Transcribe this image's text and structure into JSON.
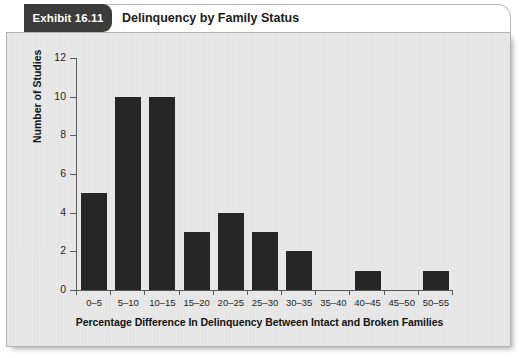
{
  "exhibit": {
    "tab_label": "Exhibit 16.11",
    "title": "Delinquency by Family Status",
    "tab_color": "#3b3b3b",
    "panel_bg": "#e9e9e9"
  },
  "chart_data": {
    "type": "bar",
    "title": "Delinquency by Family Status",
    "xlabel": "Percentage Difference In Delinquency Between Intact and Broken Families",
    "ylabel": "Number of Studies",
    "categories": [
      "0–5",
      "5–10",
      "10–15",
      "15–20",
      "20–25",
      "25–30",
      "30–35",
      "35–40",
      "40–45",
      "45–50",
      "50–55"
    ],
    "values": [
      5,
      10,
      10,
      3,
      4,
      3,
      2,
      0,
      1,
      0,
      1
    ],
    "ylim": [
      0,
      12
    ],
    "yticks": [
      0,
      2,
      4,
      6,
      8,
      10,
      12
    ],
    "ytick_labels": [
      "0",
      "2",
      "4",
      "6",
      "8",
      "10",
      "12"
    ],
    "grid": false,
    "legend": null,
    "bar_color": "#262626",
    "axis_color": "#5a5a5a"
  }
}
